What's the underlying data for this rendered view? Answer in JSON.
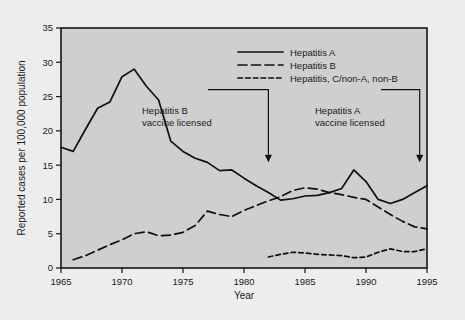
{
  "chart_data": {
    "type": "line",
    "title": "",
    "xlabel": "Year",
    "ylabel": "Reported cases per 100,000 population",
    "xlim": [
      1965,
      1995
    ],
    "ylim": [
      0,
      35
    ],
    "xticks": [
      1965,
      1970,
      1975,
      1980,
      1985,
      1990,
      1995
    ],
    "yticks": [
      0,
      5,
      10,
      15,
      20,
      25,
      30,
      35
    ],
    "grid": false,
    "legend_position": "top-right",
    "x": [
      1965,
      1966,
      1967,
      1968,
      1969,
      1970,
      1971,
      1972,
      1973,
      1974,
      1975,
      1976,
      1977,
      1978,
      1979,
      1980,
      1981,
      1982,
      1983,
      1984,
      1985,
      1986,
      1987,
      1988,
      1989,
      1990,
      1991,
      1992,
      1993,
      1994,
      1995
    ],
    "series": [
      {
        "name": "Hepatitis A",
        "style": "solid",
        "x": [
          1965,
          1966,
          1967,
          1968,
          1969,
          1970,
          1971,
          1972,
          1973,
          1974,
          1975,
          1976,
          1977,
          1978,
          1979,
          1980,
          1981,
          1982,
          1983,
          1984,
          1985,
          1986,
          1987,
          1988,
          1989,
          1990,
          1991,
          1992,
          1993,
          1994,
          1995
        ],
        "values": [
          17.6,
          17.0,
          20.2,
          23.3,
          24.2,
          27.9,
          29.0,
          26.5,
          24.5,
          18.5,
          17.0,
          16.0,
          15.4,
          14.2,
          14.3,
          13.1,
          12.0,
          11.0,
          9.9,
          10.1,
          10.5,
          10.6,
          11.0,
          11.6,
          14.3,
          12.6,
          10.0,
          9.4,
          10.0,
          11.0,
          12.0
        ]
      },
      {
        "name": "Hepatitis B",
        "style": "long-dash",
        "x": [
          1966,
          1967,
          1968,
          1969,
          1970,
          1971,
          1972,
          1973,
          1974,
          1975,
          1976,
          1977,
          1978,
          1979,
          1980,
          1981,
          1982,
          1983,
          1984,
          1985,
          1986,
          1987,
          1988,
          1989,
          1990,
          1991,
          1992,
          1993,
          1994,
          1995
        ],
        "values": [
          1.2,
          1.8,
          2.6,
          3.4,
          4.1,
          5.0,
          5.3,
          4.7,
          4.8,
          5.2,
          6.2,
          8.3,
          7.8,
          7.5,
          8.4,
          9.1,
          9.8,
          10.4,
          11.3,
          11.7,
          11.5,
          11.0,
          10.7,
          10.3,
          10.0,
          8.9,
          7.8,
          6.8,
          6.0,
          5.7
        ]
      },
      {
        "name": "Hepatitis, C/non-A, non-B",
        "style": "short-dash",
        "x": [
          1982,
          1983,
          1984,
          1985,
          1986,
          1987,
          1988,
          1989,
          1990,
          1991,
          1992,
          1993,
          1994,
          1995
        ],
        "values": [
          1.6,
          2.0,
          2.3,
          2.2,
          2.0,
          1.9,
          1.8,
          1.5,
          1.6,
          2.3,
          2.8,
          2.4,
          2.4,
          2.8
        ]
      }
    ],
    "annotations": [
      {
        "id": "hep-b-vaccine",
        "line1": "Hepatitis B",
        "line2": "vaccine licensed",
        "arrow_year": 1982,
        "arrow_top": 26.0,
        "arrow_bottom": 16.5
      },
      {
        "id": "hep-a-vaccine",
        "line1": "Hepatitis A",
        "line2": "vaccine licensed",
        "arrow_year": 1994.4,
        "arrow_top": 26.0,
        "arrow_bottom": 16.5
      }
    ],
    "colors": {
      "plot_background": "#cfcfcf",
      "page_background": "#ececec",
      "line": "#101010",
      "axis": "#151515"
    }
  },
  "legend": {
    "items": [
      {
        "label": "Hepatitis A"
      },
      {
        "label": "Hepatitis B"
      },
      {
        "label": "Hepatitis, C/non-A, non-B"
      }
    ]
  },
  "axes": {
    "y_title": "Reported cases per 100,000 population",
    "x_title": "Year",
    "yticks": [
      "0",
      "5",
      "10",
      "15",
      "20",
      "25",
      "30",
      "35"
    ],
    "xticks": [
      "1965",
      "1970",
      "1975",
      "1980",
      "1985",
      "1990",
      "1995"
    ]
  },
  "annotations": {
    "left": {
      "line1": "Hepatitis B",
      "line2": "vaccine licensed"
    },
    "right": {
      "line1": "Hepatitis A",
      "line2": "vaccine licensed"
    }
  }
}
